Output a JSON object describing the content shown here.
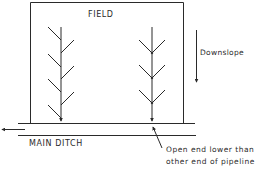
{
  "diagram": {
    "labels": {
      "field": "FIELD",
      "main_ditch": "MAIN DITCH",
      "downslope": "Downslope",
      "note_line1": "Open end lower than",
      "note_line2": "other end of pipeline"
    },
    "colors": {
      "stroke": "#2a2a2a",
      "background": "#ffffff"
    },
    "elements": {
      "field_box": "rectangle",
      "pipelines": [
        {
          "name": "herringbone-pipeline",
          "branch_style": "alternating"
        },
        {
          "name": "chevron-pipeline",
          "branch_style": "paired"
        }
      ],
      "arrows": [
        "downslope-arrow",
        "ditch-flow-arrow"
      ]
    }
  }
}
